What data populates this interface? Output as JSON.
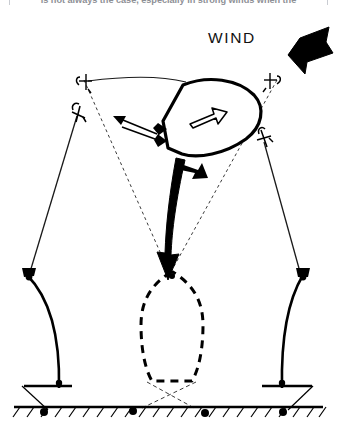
{
  "page": {
    "background_color": "#ffffff",
    "ink_color": "#000000",
    "width": 337,
    "height": 432
  },
  "clipped_caption": {
    "text": "is not always the case, especially in strong winds when the",
    "color": "#8e9096"
  },
  "wind": {
    "label": "WIND",
    "direction": "from upper-right toward lower-left",
    "arrow_color": "#000000"
  },
  "diagram": {
    "boat": {
      "name": "boat-hull-current",
      "state": "heeled / swung to windward position",
      "heading_arrow": "hollow-arrow-pointing-right",
      "outline_style": "solid"
    },
    "ghost_boat": {
      "name": "boat-hull-previous",
      "state": "original rest position",
      "outline_style": "dashed"
    },
    "swing_arrow": {
      "name": "swing-direction-arrow",
      "description": "large curved black arrow from current boat position down to previous position"
    },
    "stern_arrow": {
      "name": "stern-motion-arrow",
      "description": "small solid arrow at stern"
    },
    "rode_tension_arrow": {
      "name": "rode-tension-arrow",
      "description": "double-headed arrow showing snubbed mooring line"
    },
    "mooring_lines": [
      {
        "name": "rode-left-taut",
        "style": "solid",
        "side": "left"
      },
      {
        "name": "rode-right-taut",
        "style": "solid",
        "side": "right"
      },
      {
        "name": "rode-left-slack",
        "style": "dashed",
        "side": "left"
      },
      {
        "name": "rode-right-slack",
        "style": "dashed",
        "side": "right"
      }
    ],
    "catenary": [
      {
        "name": "chain-catenary-left",
        "side": "left"
      },
      {
        "name": "chain-catenary-right",
        "side": "right"
      }
    ],
    "anchors_on_seabed": 4,
    "buoy_markers": 4,
    "seabed": {
      "name": "seabed",
      "style": "hatched ground line"
    }
  }
}
